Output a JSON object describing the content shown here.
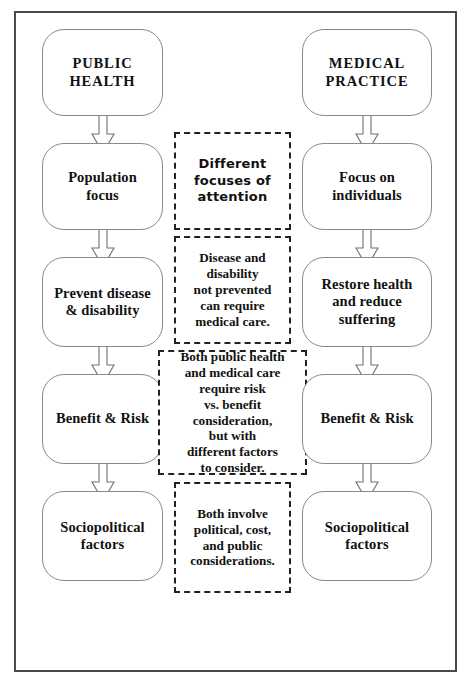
{
  "figure": {
    "frame_color": "#4a4a4a",
    "background": "#ffffff",
    "box_outline_color": "#8a8a8a",
    "note_outline_color": "#222222",
    "arrow_outline_color": "#707070"
  },
  "columns": {
    "left": {
      "name": "public-health-column",
      "nodes": [
        {
          "id": "public-health-heading",
          "label": "PUBLIC\nHEALTH"
        },
        {
          "id": "population-focus",
          "label": "Population\nfocus"
        },
        {
          "id": "prevent-disease",
          "label": "Prevent disease\n& disability"
        },
        {
          "id": "benefit-risk-left",
          "label": "Benefit & Risk"
        },
        {
          "id": "sociopolitical-left",
          "label": "Sociopolitical\nfactors"
        }
      ]
    },
    "middle": {
      "name": "shared-considerations-column",
      "notes": [
        {
          "id": "different-focuses",
          "label": "Different\nfocuses of\nattention"
        },
        {
          "id": "disease-disability",
          "label": "Disease and\ndisability\nnot prevented\ncan require\nmedical care."
        },
        {
          "id": "risk-vs-benefit",
          "label": "Both public health\nand medical care\nrequire risk\nvs. benefit\nconsideration,\nbut with\ndifferent factors\nto consider."
        },
        {
          "id": "both-involve",
          "label": "Both involve\npolitical, cost,\nand public\nconsiderations."
        }
      ]
    },
    "right": {
      "name": "medical-practice-column",
      "nodes": [
        {
          "id": "medical-practice-heading",
          "label": "MEDICAL\nPRACTICE"
        },
        {
          "id": "focus-on-individuals",
          "label": "Focus on\nindividuals"
        },
        {
          "id": "restore-health",
          "label": "Restore health\nand reduce\nsuffering"
        },
        {
          "id": "benefit-risk-right",
          "label": "Benefit & Risk"
        },
        {
          "id": "sociopolitical-right",
          "label": "Sociopolitical\nfactors"
        }
      ]
    }
  },
  "arrows": {
    "icon": "down-block-arrow",
    "count": 8,
    "direction": "down"
  }
}
